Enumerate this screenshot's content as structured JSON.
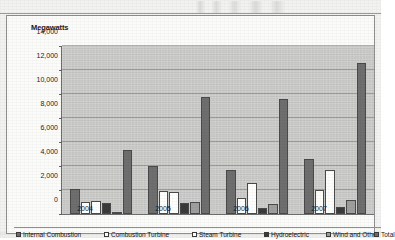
{
  "document": {
    "axis_title": "Megawatts"
  },
  "chart_data": {
    "type": "bar",
    "title": "",
    "subtitle": "",
    "xlabel": "",
    "ylabel": "Megawatts",
    "ylim": [
      0,
      14000
    ],
    "ytick_labels": [
      "14,000",
      "12,000",
      "10,000",
      "8,000",
      "6,000",
      "4,000",
      "2,000",
      "0"
    ],
    "ytick_values": [
      14000,
      12000,
      10000,
      8000,
      6000,
      4000,
      2000,
      0
    ],
    "grid": true,
    "legend_position": "bottom",
    "categories": [
      "2004",
      "2005",
      "2006",
      "2007"
    ],
    "series": [
      {
        "name": "Internal Combustion",
        "color": "#6e6e6e",
        "values": [
          2100,
          4000,
          3650,
          4550
        ]
      },
      {
        "name": "Combustion Turbine",
        "color": "#ffffff",
        "values": [
          1000,
          1900,
          1300,
          2000
        ]
      },
      {
        "name": "Steam Turbine",
        "color": "#ffffff",
        "values": [
          1050,
          1850,
          2600,
          3650
        ]
      },
      {
        "name": "Hydroelectric",
        "color": "#3a3a3a",
        "values": [
          950,
          950,
          500,
          600
        ]
      },
      {
        "name": "Wind and Other",
        "color": "#9e9e9e",
        "values": [
          150,
          1000,
          800,
          1200
        ]
      },
      {
        "name": "Total",
        "color": "#6e6e6e",
        "values": [
          5300,
          9750,
          9600,
          12600
        ]
      }
    ]
  },
  "legend": {
    "items": [
      {
        "label": "Internal Combustion",
        "style": "solid-mid"
      },
      {
        "label": "Combustion Turbine",
        "style": "outline"
      },
      {
        "label": "Steam Turbine",
        "style": "outline"
      },
      {
        "label": "Hydroelectric",
        "style": "solid-dark"
      },
      {
        "label": "Wind and Other",
        "style": "solid-light"
      },
      {
        "label": "Total",
        "style": "solid-mid"
      }
    ]
  }
}
